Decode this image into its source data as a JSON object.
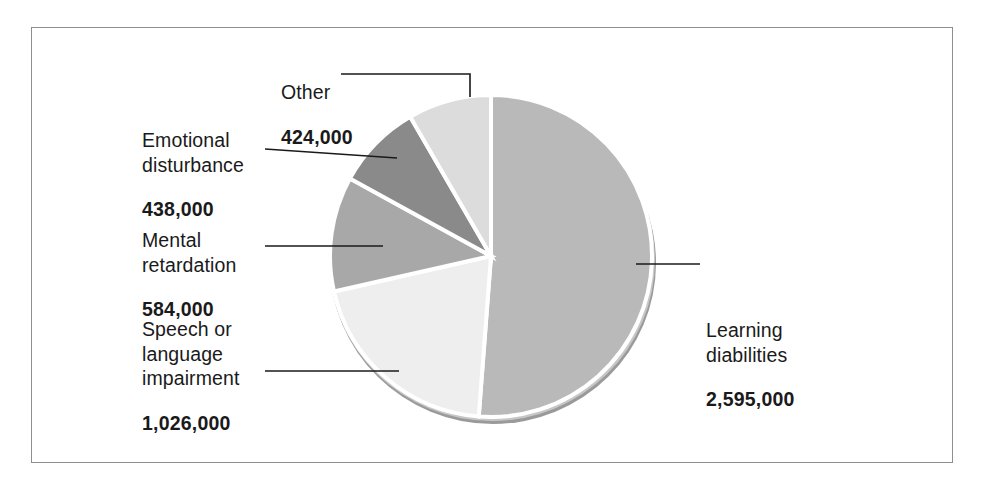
{
  "figure": {
    "frame_border_color": "#8e8e8e",
    "background_color": "#ffffff"
  },
  "chart_data": {
    "type": "pie",
    "title": "",
    "subtitle": "",
    "xlabel": "",
    "ylabel": "",
    "legend_position": "callout-labels",
    "grid": false,
    "total": 5067000,
    "units": "students",
    "categories": [
      "Learning diabilities",
      "Speech or language impairment",
      "Mental retardation",
      "Emotional disturbance",
      "Other"
    ],
    "values": [
      2595000,
      1026000,
      584000,
      438000,
      424000
    ],
    "value_labels": [
      "2,595,000",
      "1,026,000",
      "584,000",
      "438,000",
      "424,000"
    ],
    "percentages": [
      51.2,
      20.2,
      11.5,
      8.6,
      8.4
    ],
    "slice_colors": [
      "#b9b9b9",
      "#eeeeee",
      "#a8a8a8",
      "#8a8a8a",
      "#dcdcdc"
    ],
    "slices": [
      {
        "name": "Learning diabilities",
        "label_lines": [
          "Learning",
          "diabilities"
        ],
        "value_label": "2,595,000",
        "value": 2595000,
        "percent": 51.2,
        "color": "#b9b9b9",
        "start_angle": 0,
        "end_angle": 184.3
      },
      {
        "name": "Speech or language impairment",
        "label_lines": [
          "Speech or",
          "language",
          "impairment"
        ],
        "value_label": "1,026,000",
        "value": 1026000,
        "percent": 20.2,
        "color": "#eeeeee",
        "start_angle": 184.3,
        "end_angle": 257.2
      },
      {
        "name": "Mental retardation",
        "label_lines": [
          "Mental",
          "retardation"
        ],
        "value_label": "584,000",
        "value": 584000,
        "percent": 11.5,
        "color": "#a8a8a8",
        "start_angle": 257.2,
        "end_angle": 298.7
      },
      {
        "name": "Emotional disturbance",
        "label_lines": [
          "Emotional",
          "disturbance"
        ],
        "value_label": "438,000",
        "value": 438000,
        "percent": 8.6,
        "color": "#8a8a8a",
        "start_angle": 298.7,
        "end_angle": 329.8
      },
      {
        "name": "Other",
        "label_lines": [
          "Other"
        ],
        "value_label": "424,000",
        "value": 424000,
        "percent": 8.4,
        "color": "#dcdcdc",
        "start_angle": 329.8,
        "end_angle": 360
      }
    ]
  },
  "labels": {
    "other": {
      "name": "Other",
      "value": "424,000"
    },
    "emotional": {
      "name": "Emotional\ndisturbance",
      "value": "438,000"
    },
    "mental": {
      "name": "Mental\nretardation",
      "value": "584,000"
    },
    "speech": {
      "name": "Speech or\nlanguage\nimpairment",
      "value": "1,026,000"
    },
    "learning": {
      "name": "Learning\ndiabilities",
      "value": "2,595,000"
    }
  }
}
